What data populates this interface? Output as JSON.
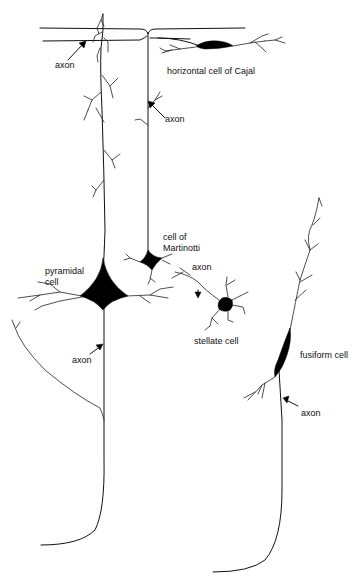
{
  "diagram": {
    "type": "neuron-types-illustration",
    "colors": {
      "ink": "#111111",
      "background": "#ffffff"
    },
    "labels": {
      "axon_top_left": "axon",
      "horizontal_cell": "horizontal cell of Cajal",
      "axon_martinotti": "axon",
      "martinotti_cell_line1": "cell of",
      "martinotti_cell_line2": "Martinotti",
      "pyramidal_cell_line1": "pyramidal",
      "pyramidal_cell_line2": "cell",
      "axon_stellate": "axon",
      "stellate_cell": "stellate cell",
      "axon_pyramidal": "axon",
      "fusiform_cell": "fusiform cell",
      "axon_fusiform": "axon"
    },
    "cells": [
      {
        "name": "horizontal cell of Cajal"
      },
      {
        "name": "cell of Martinotti"
      },
      {
        "name": "pyramidal cell"
      },
      {
        "name": "stellate cell"
      },
      {
        "name": "fusiform cell"
      }
    ]
  }
}
